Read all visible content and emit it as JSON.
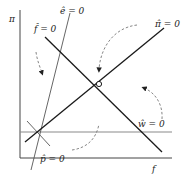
{
  "diagram": {
    "axes": {
      "y_label": "π",
      "x_label": "f"
    },
    "curves": [
      {
        "id": "e-hat",
        "label": "ê = 0",
        "style": "thin-solid"
      },
      {
        "id": "f-hat",
        "label": "f̂ = 0",
        "style": "bold-solid"
      },
      {
        "id": "pi-hat",
        "label": "π̂ = 0",
        "style": "bold-solid"
      },
      {
        "id": "w-hat",
        "label": "ŵ = 0",
        "style": "gray-horizontal"
      },
      {
        "id": "p-hat",
        "label": "p̂ = 0",
        "style": "thin-gray"
      }
    ],
    "equilibrium_marker": "open-circle",
    "flow_arrows": 4,
    "colors": {
      "line": "#1a1a1a",
      "gray_line": "#8a8a8a",
      "dashed": "#777777",
      "background": "#ffffff"
    }
  }
}
